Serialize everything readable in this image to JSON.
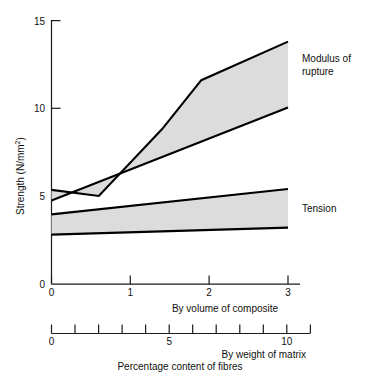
{
  "chart_data": {
    "type": "area",
    "title": "",
    "caption": "Percentage content of fibres",
    "ylabel_text": "Strength (N/mm",
    "ylabel_sup": "2",
    "ylabel_close": ")",
    "ylabel_full": "Strength (N/mm2)",
    "ylim": [
      0,
      15
    ],
    "yticks": [
      0,
      5,
      10,
      15
    ],
    "ytick_labels": [
      "0",
      "5",
      "10",
      "15"
    ],
    "grid": false,
    "legend_position": "right-inline",
    "axes": [
      {
        "name": "by-volume-of-composite",
        "label": "By volume of composite",
        "xlim": [
          0,
          3
        ],
        "ticks": [
          0,
          1,
          2,
          3
        ],
        "tick_labels": [
          "0",
          "1",
          "2",
          "3"
        ]
      },
      {
        "name": "by-weight-of-matrix",
        "label": "By weight of matrix",
        "xlim": [
          0,
          11
        ],
        "ticks": [
          0,
          1,
          2,
          3,
          4,
          5,
          6,
          7,
          8,
          9,
          10,
          11
        ],
        "tick_labels": [
          "0",
          "",
          "",
          "",
          "",
          "5",
          "",
          "",
          "",
          "",
          "10",
          ""
        ]
      }
    ],
    "bands": [
      {
        "name": "modulus-of-rupture",
        "label": "Modulus of rupture",
        "label_line1": "Modulus of",
        "label_line2": "rupture",
        "fill": "#dcdcdc",
        "stroke": "#000000",
        "upper": {
          "x": [
            0.0,
            0.6,
            1.4,
            1.9,
            3.0
          ],
          "y": [
            5.35,
            5.0,
            8.8,
            11.6,
            13.8
          ]
        },
        "lower": {
          "x": [
            0.0,
            3.0
          ],
          "y": [
            4.75,
            10.05
          ]
        }
      },
      {
        "name": "tension",
        "label": "Tension",
        "fill": "#dcdcdc",
        "stroke": "#000000",
        "upper": {
          "x": [
            0.0,
            3.0
          ],
          "y": [
            3.95,
            5.4
          ]
        },
        "lower": {
          "x": [
            0.0,
            3.0
          ],
          "y": [
            2.8,
            3.2
          ]
        }
      }
    ]
  },
  "colors": {
    "ink": "#111111",
    "band_fill": "#dcdcdc",
    "band_stroke": "#000000",
    "background": "#ffffff"
  }
}
